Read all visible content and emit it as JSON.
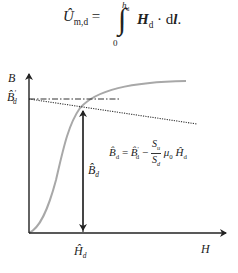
{
  "formula": {
    "lhs_symbol": "Û",
    "lhs_sub": "m,d",
    "equals": "=",
    "integral": "∫",
    "upper_limit": "h",
    "upper_limit_sub": "d",
    "lower_limit": "0",
    "integrand_vector": "H",
    "integrand_sub": "d",
    "dot": "·",
    "differential": "d",
    "differential_vector": "l",
    "period": "."
  },
  "diagram": {
    "y_axis_label": "B",
    "x_axis_label": "H",
    "remanence_label": {
      "symbol": "B̂",
      "prime": "'",
      "sub": "d"
    },
    "flux_label": {
      "symbol": "B̂",
      "sub": "d"
    },
    "field_label": {
      "symbol": "Ĥ",
      "sub": "d"
    },
    "load_line_equation": {
      "lhs": "B̂",
      "lhs_sub": "d",
      "equals": "=",
      "term1": "B̂",
      "term1_prime": "'",
      "term1_sub": "d",
      "minus": "−",
      "frac_num": "S",
      "frac_num_sub": "u",
      "frac_den": "S",
      "frac_den_sub": "d",
      "mu": "μ",
      "mu_sub": "0",
      "term2": "Ĥ",
      "term2_sub": "d"
    },
    "colors": {
      "axis": "#222222",
      "curve": "#a8a8a8",
      "load_line": "#333333",
      "reference_line": "#333333"
    }
  }
}
